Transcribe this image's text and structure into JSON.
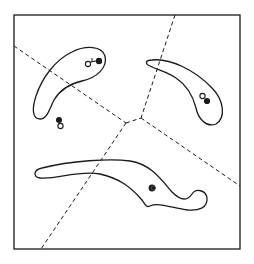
{
  "figure": {
    "width": 254,
    "height": 264,
    "stroke_color": "#1a1a1a",
    "background": "#ffffff",
    "frame": {
      "x": 14,
      "y": 15,
      "width": 226,
      "height": 234
    },
    "regions": [
      {
        "id": "upper-left-blob",
        "shape": "boomerang/bean"
      },
      {
        "id": "upper-right-blob",
        "shape": "crescent/bean"
      },
      {
        "id": "bottom-blob",
        "shape": "elongated hook"
      }
    ],
    "markers": [
      {
        "id": "ul-blob-pair",
        "filled": [
          98,
          61
        ],
        "hollow": [
          88,
          63
        ],
        "note": "hollow circle with tail linked to filled dot"
      },
      {
        "id": "left-free-pair",
        "filled": [
          59,
          120
        ],
        "hollow": [
          60,
          126
        ]
      },
      {
        "id": "ur-blob-pair",
        "filled": [
          207,
          101
        ],
        "hollow": [
          203,
          96
        ]
      },
      {
        "id": "bottom-blob-dot",
        "filled": [
          152,
          188
        ]
      }
    ],
    "dashed_boundaries": [
      {
        "from": [
          14,
          46
        ],
        "to": [
          126,
          123
        ]
      },
      {
        "from": [
          175,
          15
        ],
        "to": [
          141,
          118
        ]
      },
      {
        "from": [
          126,
          123
        ],
        "to": [
          141,
          118
        ]
      },
      {
        "from": [
          126,
          123
        ],
        "to": [
          41,
          249
        ]
      },
      {
        "from": [
          141,
          118
        ],
        "to": [
          240,
          186
        ]
      }
    ]
  }
}
